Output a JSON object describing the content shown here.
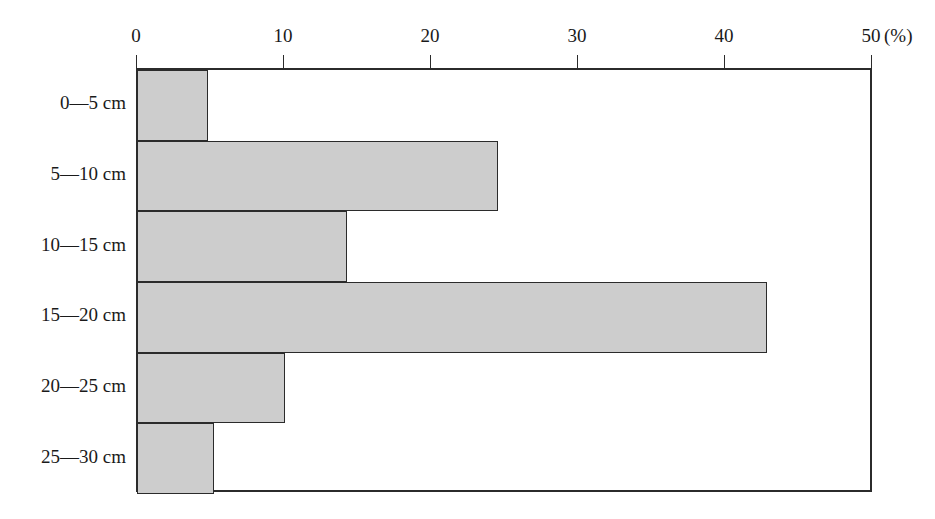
{
  "chart_data": {
    "type": "bar",
    "orientation": "horizontal",
    "title": "",
    "subtitle": "",
    "xlabel": "(%)",
    "ylabel": "",
    "categories": [
      "0—5 cm",
      "5—10 cm",
      "10—15 cm",
      "15—20 cm",
      "20—25 cm",
      "25—30 cm"
    ],
    "values": [
      4.7,
      24.5,
      14.2,
      42.9,
      10.0,
      5.1
    ],
    "xlim": [
      0,
      50
    ],
    "xticks": [
      0,
      10,
      20,
      30,
      40,
      50
    ],
    "xtick_labels": [
      "0",
      "10",
      "20",
      "30",
      "40",
      "50"
    ],
    "grid": false,
    "legend": null,
    "annotations": [],
    "bar_fill_color": "#cdcdcd",
    "bar_edge_color": "#2b2b2b",
    "axis_color": "#2b2b2b",
    "background_color": "#ffffff"
  },
  "axis": {
    "unit_label": "(%)"
  }
}
